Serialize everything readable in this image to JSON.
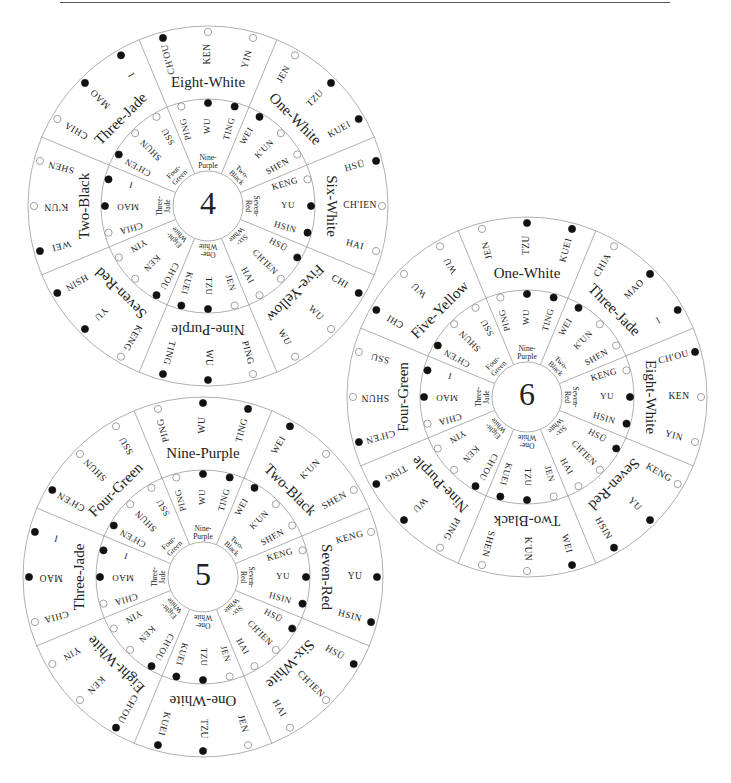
{
  "page": {
    "top_rule": true
  },
  "geometry": {
    "outer_radius": 180,
    "middle_radius": 107,
    "inner_radius": 35,
    "sector_count": 8,
    "divider_offset_deg": 22.5,
    "word_offsets_deg": [
      -15,
      0,
      15
    ]
  },
  "inner_ring": {
    "labels": [
      "Nine-Purple",
      "Two-Black",
      "Seven-Red",
      "Six-White",
      "One-White",
      "Eight-White",
      "Three-Jade",
      "Four-Green"
    ],
    "words": [
      [
        "PING",
        "WU",
        "TING"
      ],
      [
        "WEI",
        "K'UN",
        "SHEN"
      ],
      [
        "KENG",
        "YU",
        "HSIN"
      ],
      [
        "HSÜ",
        "CH'IEN",
        "HAI"
      ],
      [
        "JEN",
        "TZU",
        "KUEI"
      ],
      [
        "CH'OU",
        "KEN",
        "YIN"
      ],
      [
        "CHIA",
        "MAO",
        "I"
      ],
      [
        "CH'EN",
        "SHUN",
        "SSU"
      ]
    ],
    "dots": [
      [
        "hollow",
        "filled",
        "filled"
      ],
      [
        "filled",
        "hollow",
        "hollow"
      ],
      [
        "hollow",
        "filled",
        "filled"
      ],
      [
        "filled",
        "hollow",
        "hollow"
      ],
      [
        "hollow",
        "filled",
        "filled"
      ],
      [
        "filled",
        "hollow",
        "hollow"
      ],
      [
        "hollow",
        "filled",
        "filled"
      ],
      [
        "filled",
        "hollow",
        "hollow"
      ]
    ]
  },
  "wheels": [
    {
      "id": "wheel-4",
      "number": "4",
      "center": [
        208,
        206
      ],
      "outer_sectors": [
        {
          "label": "Eight-White",
          "words": [
            "CH'OU",
            "KEN",
            "YIN"
          ],
          "dots": [
            "filled",
            "hollow",
            "hollow"
          ]
        },
        {
          "label": "One-White",
          "words": [
            "JEN",
            "TZU",
            "KUEI"
          ],
          "dots": [
            "hollow",
            "filled",
            "filled"
          ]
        },
        {
          "label": "Six-White",
          "words": [
            "HSÜ",
            "CH'IEN",
            "HAI"
          ],
          "dots": [
            "filled",
            "hollow",
            "hollow"
          ]
        },
        {
          "label": "Five-Yellow",
          "words": [
            "CHI",
            "WU",
            "WU"
          ],
          "dots": [
            "filled",
            "hollow",
            "hollow"
          ]
        },
        {
          "label": "Nine-Purple",
          "words": [
            "PING",
            "WU",
            "TING"
          ],
          "dots": [
            "hollow",
            "filled",
            "filled"
          ]
        },
        {
          "label": "Seven-Red",
          "words": [
            "KENG",
            "YU",
            "HSIN"
          ],
          "dots": [
            "hollow",
            "filled",
            "filled"
          ]
        },
        {
          "label": "Two-Black",
          "words": [
            "WEI",
            "K'UN",
            "SHEN"
          ],
          "dots": [
            "filled",
            "hollow",
            "hollow"
          ]
        },
        {
          "label": "Three-Jade",
          "words": [
            "CHIA",
            "MAO",
            "I"
          ],
          "dots": [
            "hollow",
            "filled",
            "filled"
          ]
        }
      ]
    },
    {
      "id": "wheel-6",
      "number": "6",
      "center": [
        527,
        397
      ],
      "outer_sectors": [
        {
          "label": "One-White",
          "words": [
            "JEN",
            "TZU",
            "KUEI"
          ],
          "dots": [
            "hollow",
            "filled",
            "filled"
          ]
        },
        {
          "label": "Three-Jade",
          "words": [
            "CHIA",
            "MAO",
            "I"
          ],
          "dots": [
            "hollow",
            "filled",
            "filled"
          ]
        },
        {
          "label": "Eight-White",
          "words": [
            "CH'OU",
            "KEN",
            "YIN"
          ],
          "dots": [
            "filled",
            "hollow",
            "hollow"
          ]
        },
        {
          "label": "Seven-Red",
          "words": [
            "KENG",
            "YU",
            "HSIN"
          ],
          "dots": [
            "hollow",
            "filled",
            "filled"
          ]
        },
        {
          "label": "Two-Black",
          "words": [
            "WEI",
            "K'UN",
            "SHEN"
          ],
          "dots": [
            "filled",
            "hollow",
            "hollow"
          ]
        },
        {
          "label": "Nine-Purple",
          "words": [
            "PING",
            "WU",
            "TING"
          ],
          "dots": [
            "hollow",
            "filled",
            "filled"
          ]
        },
        {
          "label": "Four-Green",
          "words": [
            "CH'EN",
            "SHUN",
            "SSU"
          ],
          "dots": [
            "filled",
            "hollow",
            "hollow"
          ]
        },
        {
          "label": "Five-Yellow",
          "words": [
            "CHI",
            "WU",
            "WU"
          ],
          "dots": [
            "filled",
            "hollow",
            "hollow"
          ]
        }
      ]
    },
    {
      "id": "wheel-5",
      "number": "5",
      "center": [
        203,
        577
      ],
      "outer_sectors": [
        {
          "label": "Nine-Purple",
          "words": [
            "PING",
            "WU",
            "TING"
          ],
          "dots": [
            "hollow",
            "filled",
            "filled"
          ]
        },
        {
          "label": "Two-Black",
          "words": [
            "WEI",
            "K'UN",
            "SHEN"
          ],
          "dots": [
            "filled",
            "hollow",
            "hollow"
          ]
        },
        {
          "label": "Seven-Red",
          "words": [
            "KENG",
            "YU",
            "HSIN"
          ],
          "dots": [
            "hollow",
            "filled",
            "filled"
          ]
        },
        {
          "label": "Six-White",
          "words": [
            "HSÜ",
            "CH'IEN",
            "HAI"
          ],
          "dots": [
            "filled",
            "hollow",
            "hollow"
          ]
        },
        {
          "label": "One-White",
          "words": [
            "JEN",
            "TZU",
            "KUEI"
          ],
          "dots": [
            "hollow",
            "filled",
            "filled"
          ]
        },
        {
          "label": "Eight-White",
          "words": [
            "CH'OU",
            "KEN",
            "YIN"
          ],
          "dots": [
            "filled",
            "hollow",
            "hollow"
          ]
        },
        {
          "label": "Three-Jade",
          "words": [
            "CHIA",
            "MAO",
            "I"
          ],
          "dots": [
            "hollow",
            "filled",
            "filled"
          ]
        },
        {
          "label": "Four-Green",
          "words": [
            "CH'EN",
            "SHUN",
            "SSU"
          ],
          "dots": [
            "filled",
            "hollow",
            "hollow"
          ]
        }
      ]
    }
  ],
  "colors": {
    "line": "#9a9a9a",
    "text": "#222222",
    "dot_filled": "#111111",
    "rule": "#555555"
  }
}
